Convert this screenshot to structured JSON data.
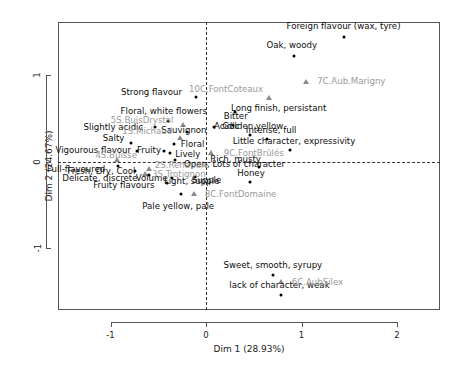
{
  "chart_data": {
    "type": "scatter",
    "title": "",
    "xlabel": "Dim 1 (28.93%)",
    "ylabel": "Dim 2 (24.67%)",
    "xlim": [
      -1.55,
      2.45
    ],
    "ylim": [
      -1.72,
      1.62
    ],
    "xticks": [
      -1,
      0,
      1,
      2
    ],
    "xticklabels": [
      "-1",
      "0",
      "1",
      "2"
    ],
    "yticks": [
      -1,
      0,
      1
    ],
    "yticklabels": [
      "-1",
      "0",
      "1"
    ],
    "grid": false,
    "legend": false,
    "reference_lines": {
      "x": 0,
      "y": 0,
      "style": "dashed"
    },
    "series": [
      {
        "name": "variables",
        "marker": "point",
        "color": "#000000",
        "label_color": "#0d0d0d",
        "points": [
          {
            "label": "Foreign flavour (wax, tyre)",
            "x": 1.44,
            "y": 1.45,
            "label_dx": 0,
            "label_dy": -11
          },
          {
            "label": "Oak, woody",
            "x": 0.92,
            "y": 1.22,
            "label_dx": -2,
            "label_dy": -11
          },
          {
            "label": "Strong flavour",
            "x": -0.11,
            "y": 0.75,
            "label_dx": -44,
            "label_dy": -5
          },
          {
            "label": "Long finish, persistant",
            "x": 0.3,
            "y": 0.58,
            "label_dx": 44,
            "label_dy": -4
          },
          {
            "label": "Floral, white flowers",
            "x": -0.4,
            "y": 0.47,
            "label_dx": -4,
            "label_dy": -10
          },
          {
            "label": "Slightly acidic",
            "x": -0.53,
            "y": 0.4,
            "label_dx": -42,
            "label_dy": 0
          },
          {
            "label": "Acidic",
            "x": 0.08,
            "y": 0.4,
            "label_dx": 13,
            "label_dy": -1
          },
          {
            "label": "Bitter",
            "x": 0.28,
            "y": 0.42,
            "label_dx": 3,
            "label_dy": -9
          },
          {
            "label": "Sauvignon",
            "x": -0.2,
            "y": 0.35,
            "label_dx": -3,
            "label_dy": -2
          },
          {
            "label": "Golden yellow",
            "x": 0.46,
            "y": 0.31,
            "label_dx": 3,
            "label_dy": -9
          },
          {
            "label": "Intense, full",
            "x": 0.64,
            "y": 0.26,
            "label_dx": 4,
            "label_dy": -9
          },
          {
            "label": "Salty",
            "x": -0.79,
            "y": 0.22,
            "label_dx": -17,
            "label_dy": -5
          },
          {
            "label": "Floral",
            "x": -0.34,
            "y": 0.21,
            "label_dx": 19,
            "label_dy": 0
          },
          {
            "label": "Little character, expressivity",
            "x": 0.88,
            "y": 0.14,
            "label_dx": 4,
            "label_dy": -9
          },
          {
            "label": "Vigourous flavour",
            "x": -0.72,
            "y": 0.12,
            "label_dx": -44,
            "label_dy": -1
          },
          {
            "label": "Fruity",
            "x": -0.44,
            "y": 0.12,
            "label_dx": -15,
            "label_dy": -1
          },
          {
            "label": "Lively",
            "x": -0.38,
            "y": 0.1,
            "label_dx": 18,
            "label_dy": 1
          },
          {
            "label": "Open, Lots of character",
            "x": -0.33,
            "y": 0.02,
            "label_dx": 60,
            "label_dy": 4
          },
          {
            "label": "Rich, musty",
            "x": 0.55,
            "y": -0.06,
            "label_dx": -23,
            "label_dy": -8
          },
          {
            "label": "Full-flavoured",
            "x": -0.92,
            "y": -0.05,
            "label_dx": -42,
            "label_dy": 3
          },
          {
            "label": "Fresh, Dry, Cool",
            "x": -0.74,
            "y": -0.11,
            "label_dx": -34,
            "label_dy": 0
          },
          {
            "label": "Volume",
            "x": -0.6,
            "y": -0.15,
            "label_dx": 3,
            "label_dy": 3
          },
          {
            "label": "Delicate, discrete",
            "x": -0.64,
            "y": -0.16,
            "label_dx": -45,
            "label_dy": 3
          },
          {
            "label": "Light, supple",
            "x": -0.36,
            "y": -0.19,
            "label_dx": 20,
            "label_dy": 3
          },
          {
            "label": "Supple",
            "x": -0.12,
            "y": -0.18,
            "label_dx": 12,
            "label_dy": 3
          },
          {
            "label": "Honey",
            "x": 0.46,
            "y": -0.23,
            "label_dx": 1,
            "label_dy": -9
          },
          {
            "label": "Fruity flavours",
            "x": -0.41,
            "y": -0.25,
            "label_dx": -43,
            "label_dy": 2
          },
          {
            "label": "Pale yellow, pale",
            "x": -0.26,
            "y": -0.38,
            "label_dx": -3,
            "label_dy": 12
          },
          {
            "label": "Sweet, smooth, syrupy",
            "x": 0.7,
            "y": -1.31,
            "label_dx": 0,
            "label_dy": -10
          },
          {
            "label": "lack of character, weak",
            "x": 0.79,
            "y": -1.55,
            "label_dx": -2,
            "label_dy": -10
          }
        ]
      },
      {
        "name": "individuals",
        "marker": "triangle",
        "color": "#8a8a8a",
        "label_color": "#9a9a9a",
        "points": [
          {
            "label": "7C.Aub.Marigny",
            "x": 1.05,
            "y": 0.92,
            "label_dx": 45,
            "label_dy": -1
          },
          {
            "label": "10C.FontCoteaux",
            "x": 0.66,
            "y": 0.74,
            "label_dx": -43,
            "label_dy": -9
          },
          {
            "label": "5S.BuisDrystal",
            "x": -0.24,
            "y": 0.43,
            "label_dx": -41,
            "label_dy": -5
          },
          {
            "label": "1S.Michaud",
            "x": -0.27,
            "y": 0.28,
            "label_dx": -33,
            "label_dy": -7
          },
          {
            "label": "9C.FontBrûlés",
            "x": 0.05,
            "y": 0.1,
            "label_dx": 43,
            "label_dy": 0
          },
          {
            "label": "4S.Buisse",
            "x": -0.93,
            "y": 0.02,
            "label_dx": -1,
            "label_dy": -5
          },
          {
            "label": "2S.Renaudie",
            "x": -0.6,
            "y": -0.09,
            "label_dx": 33,
            "label_dy": -4
          },
          {
            "label": "3S.Trotignon",
            "x": -0.64,
            "y": -0.14,
            "label_dx": 34,
            "label_dy": 0
          },
          {
            "label": "8C.FontDomaine",
            "x": -0.13,
            "y": -0.37,
            "label_dx": 47,
            "label_dy": 0
          },
          {
            "label": "6C.AubSilex",
            "x": 0.79,
            "y": -1.4,
            "label_dx": 36,
            "label_dy": 0
          }
        ]
      }
    ]
  }
}
